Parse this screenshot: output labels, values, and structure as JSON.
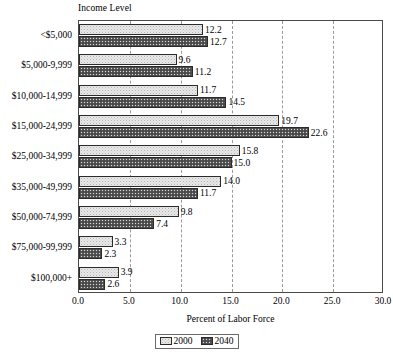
{
  "chart_data": {
    "type": "bar",
    "orientation": "horizontal",
    "title": "Income Level",
    "xlabel": "Percent of Labor Force",
    "ylabel": "Income Level",
    "xlim": [
      0.0,
      30.0
    ],
    "xticks": [
      "0.0",
      "5.0",
      "10.0",
      "15.0",
      "20.0",
      "25.0",
      "30.0"
    ],
    "xtick_values": [
      0,
      5,
      10,
      15,
      20,
      25,
      30
    ],
    "grid": "vertical-dashed",
    "legend_position": "bottom-center",
    "categories": [
      "<$5,000",
      "$5,000-9,999",
      "$10,000-14,999",
      "$15,000-24,999",
      "$25,000-34,999",
      "$35,000-49,999",
      "$50,000-74,999",
      "$75,000-99,999",
      "$100,000+"
    ],
    "series": [
      {
        "name": "2000",
        "values": [
          12.2,
          9.6,
          11.7,
          19.7,
          15.8,
          14.0,
          9.8,
          3.3,
          3.9
        ],
        "labels": [
          "12.2",
          "9.6",
          "11.7",
          "19.7",
          "15.8",
          "14.0",
          "9.8",
          "3.3",
          "3.9"
        ],
        "fill": "light-stipple"
      },
      {
        "name": "2040",
        "values": [
          12.7,
          11.2,
          14.5,
          22.6,
          15.0,
          11.7,
          7.4,
          2.3,
          2.6
        ],
        "labels": [
          "12.7",
          "11.2",
          "14.5",
          "22.6",
          "15.0",
          "11.7",
          "7.4",
          "2.3",
          "2.6"
        ],
        "fill": "dark-stipple"
      }
    ]
  },
  "legend": {
    "items": [
      {
        "label": "2000"
      },
      {
        "label": "2040"
      }
    ]
  },
  "colors": {
    "series_2000": "#e8e8e8",
    "series_2040": "#585858",
    "axis": "#4a4a4a",
    "gridline": "#9a9a9a",
    "text": "#000000",
    "background": "#ffffff"
  }
}
